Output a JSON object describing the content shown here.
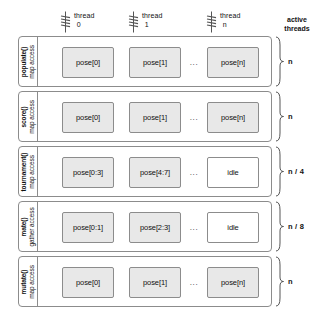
{
  "diagram": {
    "colors": {
      "box_fill": "#e8e8e8",
      "box_empty_fill": "#ffffff",
      "stroke": "#8c8c8c",
      "text": "#111111",
      "background": "#ffffff"
    }
  },
  "thread_header": {
    "icon_name": "thread-squiggle-icon",
    "threads": [
      {
        "label": "thread",
        "index": "0"
      },
      {
        "label": "thread",
        "index": "1"
      },
      {
        "label": "thread",
        "index": "n"
      }
    ]
  },
  "active_threads_header": {
    "line1": "active",
    "line2": "threads"
  },
  "ellipsis": "...",
  "stages": [
    {
      "function": "populate()",
      "access": "map access",
      "cells": [
        {
          "label": "pose[0]",
          "state": "filled"
        },
        {
          "label": "pose[1]",
          "state": "filled"
        },
        {
          "label": "pose[n]",
          "state": "filled"
        }
      ],
      "active_threads": "n"
    },
    {
      "function": "score()",
      "access": "map access",
      "cells": [
        {
          "label": "pose[0]",
          "state": "filled"
        },
        {
          "label": "pose[1]",
          "state": "filled"
        },
        {
          "label": "pose[n]",
          "state": "filled"
        }
      ],
      "active_threads": "n"
    },
    {
      "function": "tournament()",
      "access": "map access",
      "cells": [
        {
          "label": "pose[0:3]",
          "state": "filled"
        },
        {
          "label": "pose[4:7]",
          "state": "filled"
        },
        {
          "label": "idle",
          "state": "empty"
        }
      ],
      "active_threads": "n / 4"
    },
    {
      "function": "mate()",
      "access": "gather access",
      "cells": [
        {
          "label": "pose[0:1]",
          "state": "filled"
        },
        {
          "label": "pose[2:3]",
          "state": "filled"
        },
        {
          "label": "idle",
          "state": "empty"
        }
      ],
      "active_threads": "n / 8"
    },
    {
      "function": "mutate()",
      "access": "map access",
      "cells": [
        {
          "label": "pose[0]",
          "state": "filled"
        },
        {
          "label": "pose[1]",
          "state": "filled"
        },
        {
          "label": "pose[n]",
          "state": "filled"
        }
      ],
      "active_threads": "n"
    }
  ]
}
